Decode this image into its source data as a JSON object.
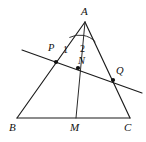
{
  "figure": {
    "background_color": "#ffffff",
    "stroke_color": "#1b1b1b",
    "label_color": "#111111",
    "width": 146,
    "height": 142
  },
  "labels": {
    "apex": "A",
    "left_base": "B",
    "right_base": "C",
    "midpoint": "M",
    "point_p": "P",
    "point_q": "Q",
    "point_n": "N",
    "angle_one": "1",
    "angle_two": "2"
  },
  "geometry": {
    "points": {
      "A": {
        "x": 85,
        "y": 22
      },
      "B": {
        "x": 17,
        "y": 118
      },
      "C": {
        "x": 130,
        "y": 118
      },
      "M": {
        "x": 76,
        "y": 118
      },
      "P": {
        "x": 56,
        "y": 62
      },
      "N": {
        "x": 78,
        "y": 68
      },
      "Q": {
        "x": 113,
        "y": 80
      }
    },
    "segments": [
      {
        "name": "side-AB",
        "from": "A",
        "to": "B"
      },
      {
        "name": "side-AC",
        "from": "A",
        "to": "C"
      },
      {
        "name": "side-BC",
        "from": "B",
        "to": "C"
      },
      {
        "name": "cevian-AM",
        "from": "A",
        "to": "M"
      }
    ],
    "transversal": {
      "name": "line-PQ",
      "start": {
        "x": 22,
        "y": 50
      },
      "end": {
        "x": 142,
        "y": 93
      }
    },
    "marked_points": [
      "P",
      "N",
      "Q"
    ],
    "angle_arc": {
      "vertex": "A",
      "radius": 22,
      "from_point": "B",
      "to_point": "C"
    }
  },
  "label_positions": {
    "A": {
      "x": 81,
      "y": 6
    },
    "B": {
      "x": 9,
      "y": 122
    },
    "C": {
      "x": 124,
      "y": 122
    },
    "M": {
      "x": 70,
      "y": 122
    },
    "P": {
      "x": 48,
      "y": 43
    },
    "Q": {
      "x": 116,
      "y": 66
    },
    "N": {
      "x": 78,
      "y": 56
    },
    "angle_one": {
      "x": 63,
      "y": 45
    },
    "angle_two": {
      "x": 80,
      "y": 44
    }
  }
}
